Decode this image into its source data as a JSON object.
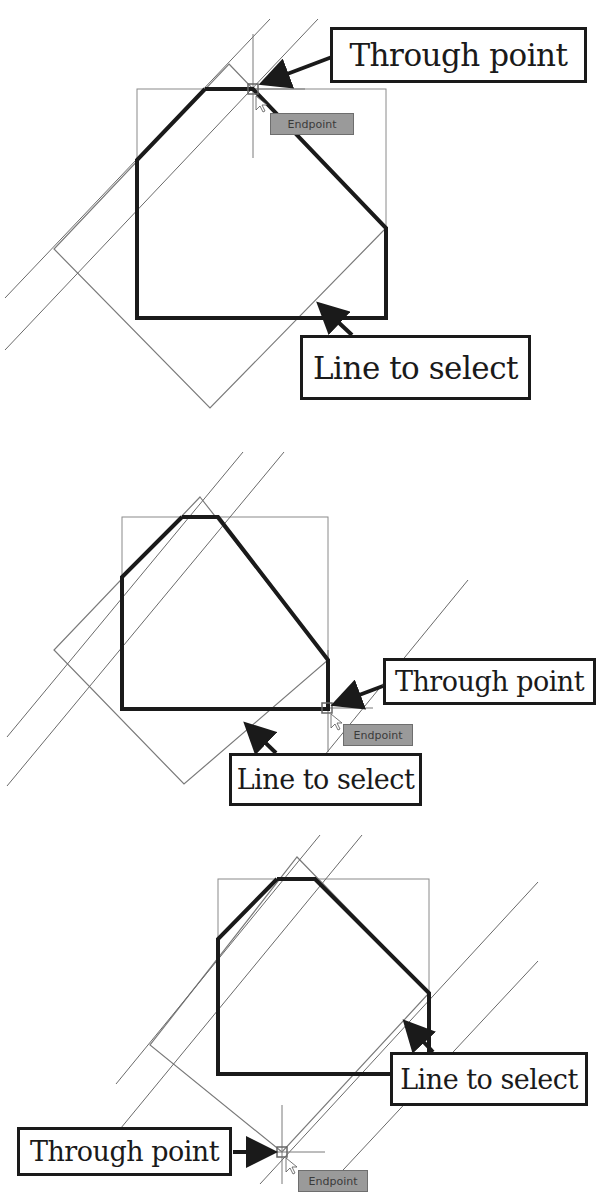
{
  "figure": {
    "top_fragment_text": "",
    "panels": [
      {
        "id": "panel-1",
        "through_point_label": "Through point",
        "line_to_select_label": "Line to select",
        "snap_tooltip": "Endpoint",
        "through_point": [
          253,
          89
        ],
        "snap_location": "top edge endpoint"
      },
      {
        "id": "panel-2",
        "through_point_label": "Through point",
        "line_to_select_label": "Line to select",
        "snap_tooltip": "Endpoint",
        "through_point": [
          327,
          708
        ],
        "snap_location": "bottom-right corner"
      },
      {
        "id": "panel-3",
        "through_point_label": "Through point",
        "line_to_select_label": "Line to select",
        "snap_tooltip": "Endpoint",
        "through_point": [
          282,
          1152
        ],
        "snap_location": "bottom vertex of rotated rectangle"
      }
    ],
    "colors": {
      "heavy_outline": "#1a1a1a",
      "thin_construction": "#7a7a7a",
      "tooltip_bg": "#9a9a9a",
      "callout_border": "#1a1a1a"
    }
  }
}
